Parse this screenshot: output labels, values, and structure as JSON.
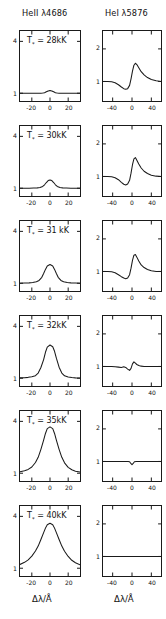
{
  "figure": {
    "columns": [
      {
        "header": "HeII λ4686",
        "xlabel": "Δλ/Å"
      },
      {
        "header": "HeI λ5876",
        "xlabel": "Δλ/Å"
      }
    ],
    "rows": [
      {
        "temp_label": "T",
        "sub": "*",
        "eq": " = 28kK"
      },
      {
        "temp_label": "T",
        "sub": "*",
        "eq": " = 30kK"
      },
      {
        "temp_label": "T",
        "sub": "*",
        "eq": " = 31 kK"
      },
      {
        "temp_label": "T",
        "sub": "*",
        "eq": " = 32kK"
      },
      {
        "temp_label": "T",
        "sub": "*",
        "eq": " = 35kK"
      },
      {
        "temp_label": "T",
        "sub": "*",
        "eq": " = 40kK"
      }
    ],
    "ticks": {
      "left_x": [
        "-20",
        "0",
        "20"
      ],
      "right_x": [
        "-40",
        "0",
        "40"
      ],
      "left_y": [
        "4",
        "1"
      ],
      "right_y": [
        "2",
        "1"
      ]
    }
  },
  "chart_data": {
    "type": "line",
    "xlabel": "Δλ/Å",
    "ylabel": "Normalized flux",
    "grid": false,
    "legend": "none",
    "panels": [
      {
        "row": 0,
        "col": 0,
        "line": "HeII λ4686",
        "annotation": "T* = 28kK",
        "xlim": [
          -33,
          33
        ],
        "ylim": [
          0.55,
          4.6
        ],
        "yticks": [
          4,
          1
        ],
        "xticks": [
          -20,
          0,
          20
        ],
        "x": [
          -33,
          -28,
          -23,
          -18,
          -13,
          -10,
          -8,
          -6,
          -4,
          -2,
          0,
          2,
          4,
          6,
          8,
          10,
          13,
          18,
          23,
          28,
          33
        ],
        "y": [
          1.0,
          1.0,
          1.0,
          1.0,
          1.0,
          1.0,
          1.01,
          1.03,
          1.08,
          1.13,
          1.16,
          1.13,
          1.08,
          1.03,
          1.01,
          1.0,
          1.0,
          1.0,
          1.0,
          1.0,
          1.0
        ]
      },
      {
        "row": 1,
        "col": 0,
        "line": "HeII λ4686",
        "annotation": "T* = 30kK",
        "xlim": [
          -33,
          33
        ],
        "ylim": [
          0.55,
          4.6
        ],
        "yticks": [
          4,
          1
        ],
        "xticks": [
          -20,
          0,
          20
        ],
        "x": [
          -33,
          -28,
          -23,
          -18,
          -14,
          -11,
          -8,
          -6,
          -4,
          -2,
          0,
          2,
          4,
          6,
          8,
          11,
          14,
          18,
          23,
          28,
          33
        ],
        "y": [
          1.0,
          1.0,
          1.0,
          1.01,
          1.02,
          1.04,
          1.1,
          1.2,
          1.33,
          1.44,
          1.48,
          1.44,
          1.33,
          1.2,
          1.1,
          1.04,
          1.02,
          1.01,
          1.0,
          1.0,
          1.0
        ]
      },
      {
        "row": 2,
        "col": 0,
        "line": "HeII λ4686",
        "annotation": "T* = 31 kK",
        "xlim": [
          -33,
          33
        ],
        "ylim": [
          0.55,
          4.6
        ],
        "yticks": [
          4,
          1
        ],
        "xticks": [
          -20,
          0,
          20
        ],
        "x": [
          -33,
          -28,
          -23,
          -19,
          -15,
          -12,
          -9,
          -7,
          -5,
          -3,
          0,
          3,
          5,
          7,
          9,
          12,
          15,
          19,
          23,
          28,
          33
        ],
        "y": [
          1.0,
          1.01,
          1.02,
          1.04,
          1.08,
          1.16,
          1.34,
          1.56,
          1.8,
          2.0,
          2.08,
          2.0,
          1.8,
          1.56,
          1.34,
          1.16,
          1.08,
          1.04,
          1.02,
          1.01,
          1.0
        ]
      },
      {
        "row": 3,
        "col": 0,
        "line": "HeII λ4686",
        "annotation": "T* = 32kK",
        "xlim": [
          -33,
          33
        ],
        "ylim": [
          0.55,
          4.6
        ],
        "yticks": [
          4,
          1
        ],
        "xticks": [
          -20,
          0,
          20
        ],
        "x": [
          -33,
          -28,
          -24,
          -20,
          -16,
          -13,
          -10,
          -7,
          -5,
          -3,
          0,
          3,
          5,
          7,
          10,
          13,
          16,
          20,
          24,
          28,
          33
        ],
        "y": [
          1.02,
          1.03,
          1.05,
          1.08,
          1.15,
          1.3,
          1.62,
          2.08,
          2.5,
          2.8,
          2.92,
          2.82,
          2.56,
          2.16,
          1.64,
          1.3,
          1.14,
          1.07,
          1.04,
          1.02,
          1.01
        ]
      },
      {
        "row": 4,
        "col": 0,
        "line": "HeII λ4686",
        "annotation": "T* = 35kK",
        "xlim": [
          -33,
          33
        ],
        "ylim": [
          0.55,
          4.6
        ],
        "yticks": [
          4,
          1
        ],
        "xticks": [
          -20,
          0,
          20
        ],
        "x": [
          -33,
          -28,
          -24,
          -20,
          -16,
          -13,
          -10,
          -7,
          -5,
          -3,
          0,
          3,
          5,
          7,
          10,
          13,
          16,
          20,
          24,
          28,
          33
        ],
        "y": [
          1.08,
          1.14,
          1.22,
          1.36,
          1.62,
          1.92,
          2.38,
          2.92,
          3.3,
          3.58,
          3.68,
          3.58,
          3.3,
          2.92,
          2.38,
          1.92,
          1.6,
          1.34,
          1.2,
          1.12,
          1.07
        ]
      },
      {
        "row": 5,
        "col": 0,
        "line": "HeII λ4686",
        "annotation": "T* = 40kK",
        "xlim": [
          -33,
          33
        ],
        "ylim": [
          0.55,
          4.6
        ],
        "yticks": [
          4,
          1
        ],
        "xticks": [
          -20,
          0,
          20
        ],
        "x": [
          -33,
          -28,
          -24,
          -20,
          -16,
          -13,
          -10,
          -7,
          -5,
          -3,
          0,
          3,
          5,
          7,
          10,
          13,
          16,
          20,
          24,
          28,
          33
        ],
        "y": [
          1.22,
          1.34,
          1.48,
          1.7,
          2.0,
          2.28,
          2.66,
          3.06,
          3.32,
          3.52,
          3.6,
          3.52,
          3.32,
          3.06,
          2.66,
          2.28,
          1.98,
          1.68,
          1.46,
          1.32,
          1.2
        ]
      },
      {
        "row": 0,
        "col": 1,
        "line": "HeI λ5876",
        "annotation": "T* = 28kK",
        "xlim": [
          -60,
          60
        ],
        "ylim": [
          0.4,
          2.55
        ],
        "yticks": [
          2,
          1
        ],
        "xticks": [
          -40,
          0,
          40
        ],
        "x": [
          -60,
          -50,
          -42,
          -35,
          -28,
          -22,
          -17,
          -13,
          -9,
          -5,
          -2,
          1,
          4,
          7,
          10,
          14,
          19,
          25,
          32,
          40,
          50,
          60
        ],
        "y": [
          1.0,
          1.0,
          0.99,
          0.96,
          0.9,
          0.83,
          0.78,
          0.76,
          0.78,
          0.88,
          1.08,
          1.32,
          1.5,
          1.56,
          1.52,
          1.42,
          1.3,
          1.2,
          1.12,
          1.06,
          1.02,
          1.0
        ]
      },
      {
        "row": 1,
        "col": 1,
        "line": "HeI λ5876",
        "annotation": "T* = 30kK",
        "xlim": [
          -60,
          60
        ],
        "ylim": [
          0.4,
          2.55
        ],
        "yticks": [
          2,
          1
        ],
        "xticks": [
          -40,
          0,
          40
        ],
        "x": [
          -60,
          -50,
          -42,
          -35,
          -28,
          -22,
          -17,
          -13,
          -9,
          -5,
          -2,
          1,
          4,
          7,
          10,
          14,
          19,
          25,
          32,
          40,
          50,
          60
        ],
        "y": [
          1.0,
          1.0,
          0.99,
          0.96,
          0.9,
          0.82,
          0.76,
          0.74,
          0.77,
          0.88,
          1.1,
          1.36,
          1.54,
          1.58,
          1.5,
          1.38,
          1.26,
          1.16,
          1.09,
          1.04,
          1.01,
          1.0
        ]
      },
      {
        "row": 2,
        "col": 1,
        "line": "HeI λ5876",
        "annotation": "T* = 31 kK",
        "xlim": [
          -60,
          60
        ],
        "ylim": [
          0.4,
          2.55
        ],
        "yticks": [
          2,
          1
        ],
        "xticks": [
          -40,
          0,
          40
        ],
        "x": [
          -60,
          -50,
          -42,
          -35,
          -28,
          -22,
          -17,
          -13,
          -9,
          -5,
          -2,
          1,
          4,
          7,
          10,
          14,
          19,
          25,
          32,
          40,
          50,
          60
        ],
        "y": [
          1.0,
          1.0,
          0.99,
          0.96,
          0.9,
          0.84,
          0.8,
          0.78,
          0.8,
          0.9,
          1.1,
          1.34,
          1.5,
          1.52,
          1.44,
          1.32,
          1.2,
          1.12,
          1.06,
          1.02,
          1.0,
          1.0
        ]
      },
      {
        "row": 3,
        "col": 1,
        "line": "HeI λ5876",
        "annotation": "T* = 32kK",
        "xlim": [
          -60,
          60
        ],
        "ylim": [
          0.4,
          2.55
        ],
        "yticks": [
          2,
          1
        ],
        "xticks": [
          -40,
          0,
          40
        ],
        "x": [
          -60,
          -50,
          -42,
          -35,
          -28,
          -22,
          -17,
          -13,
          -9,
          -5,
          -2,
          1,
          4,
          7,
          10,
          14,
          19,
          25,
          32,
          40,
          50,
          60
        ],
        "y": [
          1.0,
          1.0,
          1.0,
          0.99,
          0.98,
          0.97,
          0.99,
          0.97,
          0.92,
          0.88,
          0.94,
          1.08,
          1.14,
          1.1,
          1.06,
          1.03,
          1.01,
          1.0,
          1.0,
          1.0,
          1.0,
          1.0
        ]
      },
      {
        "row": 4,
        "col": 1,
        "line": "HeI λ5876",
        "annotation": "T* = 35kK",
        "xlim": [
          -60,
          60
        ],
        "ylim": [
          0.4,
          2.55
        ],
        "yticks": [
          2,
          1
        ],
        "xticks": [
          -40,
          0,
          40
        ],
        "x": [
          -60,
          -50,
          -42,
          -35,
          -28,
          -22,
          -17,
          -12,
          -8,
          -5,
          -2,
          0,
          2,
          5,
          9,
          14,
          20,
          28,
          38,
          48,
          60
        ],
        "y": [
          1.0,
          1.0,
          1.0,
          1.0,
          1.0,
          1.0,
          1.0,
          1.0,
          1.0,
          0.99,
          0.93,
          0.9,
          0.93,
          0.99,
          1.0,
          1.0,
          1.0,
          1.0,
          1.0,
          1.0,
          1.0
        ]
      },
      {
        "row": 5,
        "col": 1,
        "line": "HeI λ5876",
        "annotation": "T* = 40kK",
        "xlim": [
          -60,
          60
        ],
        "ylim": [
          0.4,
          2.55
        ],
        "yticks": [
          2,
          1
        ],
        "xticks": [
          -40,
          0,
          40
        ],
        "x": [
          -60,
          -40,
          -20,
          0,
          20,
          40,
          60
        ],
        "y": [
          1.0,
          1.0,
          1.0,
          1.0,
          1.0,
          1.0,
          1.0
        ]
      }
    ]
  }
}
